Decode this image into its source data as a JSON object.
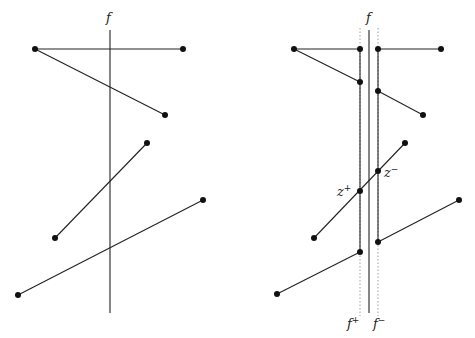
{
  "left_panel": {
    "line_label": "f",
    "line": {
      "x": 110,
      "y1": 30,
      "y2": 313
    },
    "segments": [
      {
        "x1": 35,
        "y1": 49,
        "x2": 183,
        "y2": 49
      },
      {
        "x1": 35,
        "y1": 49,
        "x2": 165,
        "y2": 115
      },
      {
        "x1": 147,
        "y1": 143,
        "x2": 55,
        "y2": 238
      },
      {
        "x1": 203,
        "y1": 200,
        "x2": 18,
        "y2": 295
      }
    ]
  },
  "right_panel": {
    "line_label": "f",
    "f_plus_label": "f",
    "f_plus_sup": "+",
    "f_minus_label": "f",
    "f_minus_sup": "−",
    "z_plus_label": "z",
    "z_plus_sup": "+",
    "z_minus_label": "z",
    "z_minus_sup": "−"
  },
  "colors": {
    "ink": "#222222",
    "dotted": "#888888"
  }
}
